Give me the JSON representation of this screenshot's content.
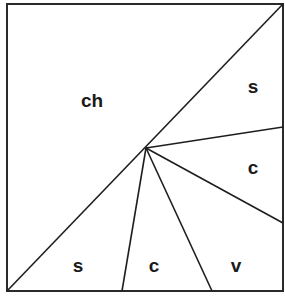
{
  "diagram": {
    "type": "square partition diagram",
    "colors": {
      "line": "#1e1e1e",
      "background": "#ffffff",
      "text": "#1a1a1a"
    },
    "frame": {
      "x1": 7,
      "y1": 4,
      "x2": 283,
      "y2": 291
    },
    "center_point": {
      "x": 146,
      "y": 148
    },
    "regions": [
      {
        "id": "upper-left",
        "label": "ch",
        "x": 92,
        "y": 107
      },
      {
        "id": "upper-right",
        "label": "s",
        "x": 253,
        "y": 93
      },
      {
        "id": "right-middle",
        "label": "c",
        "x": 253,
        "y": 174
      },
      {
        "id": "bottom-left",
        "label": "s",
        "x": 78,
        "y": 272
      },
      {
        "id": "bottom-center",
        "label": "c",
        "x": 154,
        "y": 272
      },
      {
        "id": "bottom-right",
        "label": "v",
        "x": 236,
        "y": 272
      }
    ],
    "lines": [
      {
        "id": "diagonal",
        "from": [
          7,
          291
        ],
        "to": [
          283,
          4
        ]
      },
      {
        "id": "to-right-upper",
        "from": [
          146,
          148
        ],
        "to": [
          283,
          127
        ]
      },
      {
        "id": "to-right-lower",
        "from": [
          146,
          148
        ],
        "to": [
          283,
          223
        ]
      },
      {
        "id": "to-bottom-left",
        "from": [
          146,
          148
        ],
        "to": [
          122,
          291
        ]
      },
      {
        "id": "to-bottom-right",
        "from": [
          146,
          148
        ],
        "to": [
          212,
          291
        ]
      }
    ]
  }
}
